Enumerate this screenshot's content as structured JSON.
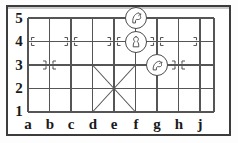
{
  "diagram": {
    "kind": "xiangqi-board-diagram",
    "width": 238,
    "height": 143,
    "colors": {
      "frame": "#3c3c3c",
      "grid_line": "#555555",
      "marker": "#555555",
      "label_text": "#1a1a1a",
      "piece_outline": "#4a4a4a",
      "piece_fill": "#ffffff",
      "background": "#ffffff"
    }
  },
  "axes": {
    "files": [
      "a",
      "b",
      "c",
      "d",
      "e",
      "f",
      "g",
      "h",
      "j"
    ],
    "ranks": [
      "5",
      "4",
      "3",
      "2",
      "1"
    ]
  },
  "geometry": {
    "origin_x": 28,
    "origin_y": 18,
    "cell_width": 21.5,
    "cell_height": 23.5,
    "file_count": 9,
    "rank_count": 5,
    "right_margin_x": 214
  },
  "palace": {
    "label": "palace-cross",
    "diagonals": [
      {
        "from": "d3",
        "to": "f1"
      },
      {
        "from": "d1",
        "to": "f3"
      }
    ],
    "center": "e2"
  },
  "position_markers": [
    {
      "file": "a",
      "rank": "4"
    },
    {
      "file": "c",
      "rank": "4"
    },
    {
      "file": "e",
      "rank": "4"
    },
    {
      "file": "g",
      "rank": "4"
    },
    {
      "file": "j",
      "rank": "4"
    },
    {
      "file": "b",
      "rank": "3"
    },
    {
      "file": "h",
      "rank": "3"
    }
  ],
  "pieces": [
    {
      "id": "piece-f5",
      "glyph": "horse-icon",
      "name": "horse",
      "file": "f",
      "rank": "5",
      "square": "f5"
    },
    {
      "id": "piece-f4",
      "glyph": "pawn-icon",
      "name": "pawn",
      "file": "f",
      "rank": "4",
      "square": "f4"
    },
    {
      "id": "piece-g3",
      "glyph": "horse-icon",
      "name": "horse",
      "file": "g",
      "rank": "3",
      "square": "g3"
    }
  ]
}
